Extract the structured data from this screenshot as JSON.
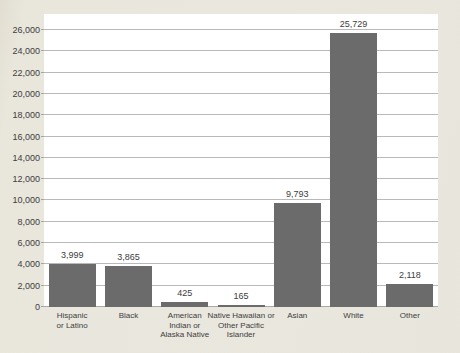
{
  "figure": {
    "background_color": "#e9e6dc",
    "plot_background": "#ffffff",
    "bar_color": "#6b6b6b",
    "gridline_color": "#b9b9b9",
    "text_color": "#3d3d3d"
  },
  "chart_data": {
    "type": "bar",
    "title": "",
    "xlabel": "",
    "ylabel": "",
    "categories": [
      "Hispanic or Latino",
      "Black",
      "American Indian or Alaska Native",
      "Native Hawaiian or Other Pacific Islander",
      "Asian",
      "White",
      "Other"
    ],
    "category_label_lines": [
      [
        "Hispanic",
        "or Latino"
      ],
      [
        "Black"
      ],
      [
        "American",
        "Indian or",
        "Alaska Native"
      ],
      [
        "Native Hawaiian or",
        "Other Pacific",
        "Islander"
      ],
      [
        "Asian"
      ],
      [
        "White"
      ],
      [
        "Other"
      ]
    ],
    "values": [
      3999,
      3865,
      425,
      165,
      9793,
      25729,
      2118
    ],
    "value_labels": [
      "3,999",
      "3,865",
      "425",
      "165",
      "9,793",
      "25,729",
      "2,118"
    ],
    "ylim": [
      0,
      26000
    ],
    "ytick_step": 2000,
    "ytick_values": [
      0,
      2000,
      4000,
      6000,
      8000,
      10000,
      12000,
      14000,
      16000,
      18000,
      20000,
      22000,
      24000,
      26000
    ],
    "ytick_labels": [
      "0",
      "2,000",
      "4,000",
      "6,000",
      "8,000",
      "10,000",
      "12,000",
      "14,000",
      "16,000",
      "18,000",
      "20,000",
      "22,000",
      "24,000",
      "26,000"
    ],
    "grid": true,
    "legend": false,
    "bar_orientation": "vertical"
  }
}
